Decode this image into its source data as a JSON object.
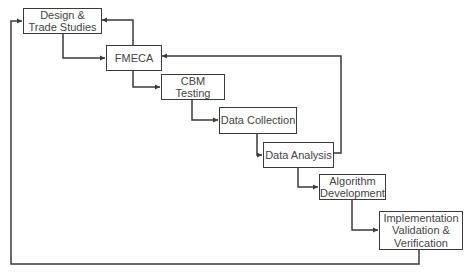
{
  "diagram": {
    "type": "waterfall-process-flow",
    "nodes": [
      {
        "id": "design",
        "label": "Design &\nTrade Studies"
      },
      {
        "id": "fmeca",
        "label": "FMECA"
      },
      {
        "id": "cbm",
        "label": "CBM Testing"
      },
      {
        "id": "collection",
        "label": "Data Collection"
      },
      {
        "id": "analysis",
        "label": "Data Analysis"
      },
      {
        "id": "algorithm",
        "label": "Algorithm\nDevelopment"
      },
      {
        "id": "implementation",
        "label": "Implementation\nValidation &\nVerification"
      }
    ],
    "edges": [
      {
        "from": "design",
        "to": "fmeca"
      },
      {
        "from": "fmeca",
        "to": "cbm"
      },
      {
        "from": "cbm",
        "to": "collection"
      },
      {
        "from": "collection",
        "to": "analysis"
      },
      {
        "from": "analysis",
        "to": "algorithm"
      },
      {
        "from": "algorithm",
        "to": "implementation"
      },
      {
        "from": "fmeca",
        "to": "design",
        "kind": "feedback"
      },
      {
        "from": "analysis",
        "to": "fmeca",
        "kind": "feedback"
      },
      {
        "from": "implementation",
        "to": "design",
        "kind": "feedback"
      }
    ],
    "colors": {
      "line": "#3a3a3a",
      "text": "#444444",
      "background": "#ffffff"
    }
  }
}
